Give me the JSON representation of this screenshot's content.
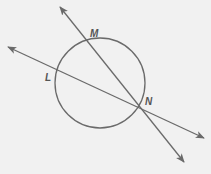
{
  "diagram": {
    "colors": {
      "stroke": "#6a6a6a",
      "label": "#555555",
      "background": "#f1f1f1"
    },
    "circle": {
      "cx": 100,
      "cy": 83,
      "r": 45
    },
    "points": [
      {
        "name": "M",
        "x": 87,
        "y": 41,
        "label_x": 92,
        "label_y": 36
      },
      {
        "name": "L",
        "x": 56,
        "y": 71,
        "label_x": 46,
        "label_y": 80
      },
      {
        "name": "N",
        "x": 138,
        "y": 106,
        "label_x": 146,
        "label_y": 104
      }
    ],
    "lines": [
      {
        "name": "line-MN",
        "through": [
          "M",
          "N"
        ],
        "x1": 60,
        "y1": 7,
        "x2": 184,
        "y2": 162
      },
      {
        "name": "line-LN",
        "through": [
          "L",
          "N"
        ],
        "x1": 8,
        "y1": 47,
        "x2": 204,
        "y2": 138
      }
    ],
    "labels": {
      "M": "M",
      "L": "L",
      "N": "N"
    }
  }
}
